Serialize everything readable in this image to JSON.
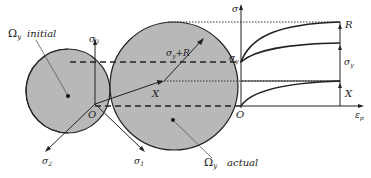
{
  "diagram": {
    "labels": {
      "initial_surface": {
        "symbol": "Ω",
        "sub": "y",
        "text": "initial"
      },
      "actual_surface": {
        "symbol": "Ω",
        "sub": "y",
        "text": "actual"
      },
      "sigma1": {
        "symbol": "σ",
        "sub": "1"
      },
      "sigma2": {
        "symbol": "σ",
        "sub": "2"
      },
      "sigma3": {
        "symbol": "σ",
        "sub": "3"
      },
      "origin_left": "O",
      "backstress": "X",
      "radius": {
        "symbol": "σ",
        "sub": "y",
        "suffix": "+R"
      },
      "graph_y_axis": "σ",
      "graph_x_axis": {
        "symbol": "ε",
        "sub": "p"
      },
      "graph_origin": "O",
      "graph_sigma_y": {
        "symbol": "σ",
        "sub": "y"
      },
      "graph_R": "R",
      "graph_sigma_y_right": {
        "symbol": "σ",
        "sub": "y"
      },
      "graph_X": "X"
    },
    "colors": {
      "surface_fill": "#b8b8b8",
      "stroke": "#222222",
      "background": "#ffffff"
    }
  }
}
